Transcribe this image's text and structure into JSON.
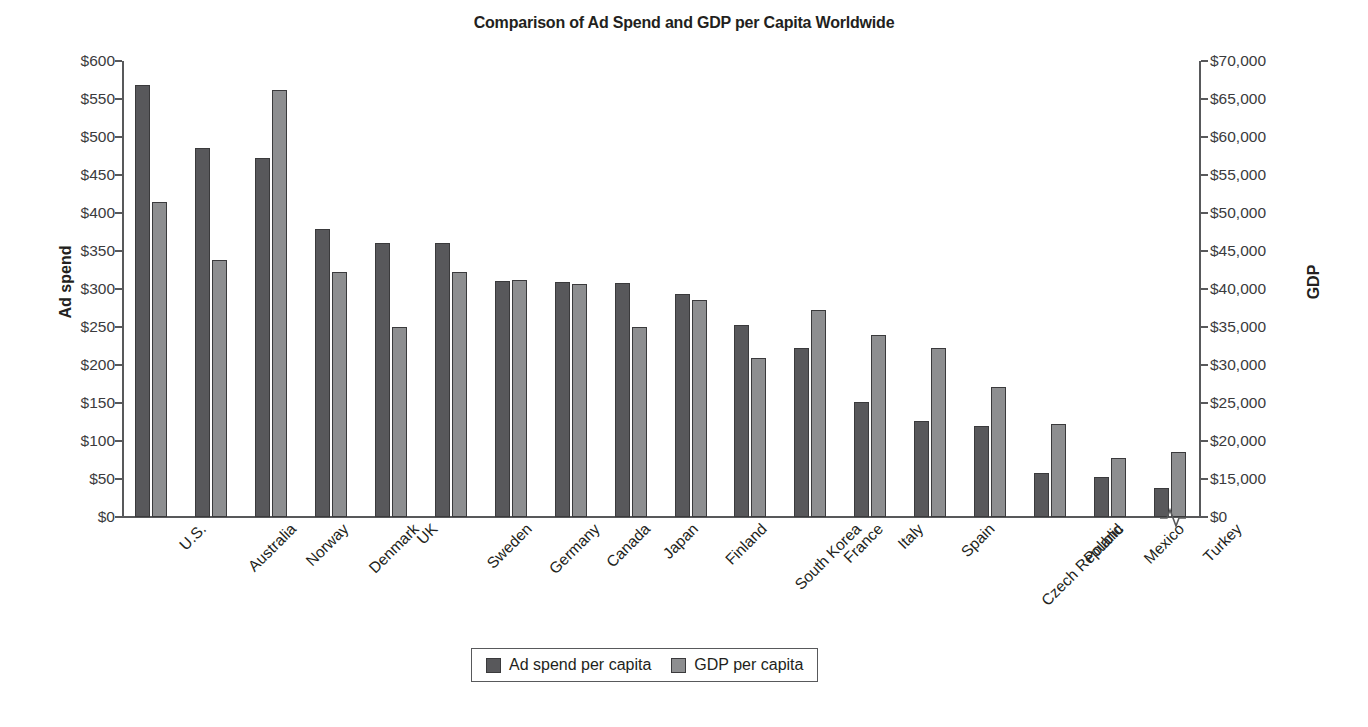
{
  "chart_data": {
    "type": "bar",
    "title": "Comparison of Ad Spend and GDP per Capita Worldwide",
    "xlabel": "",
    "ylabel": "Ad spend",
    "ylabel_right": "GDP",
    "grid": false,
    "legend_position": "bottom",
    "categories": [
      "U.S.",
      "Australia",
      "Norway",
      "Denmark",
      "UK",
      "Sweden",
      "Germany",
      "Canada",
      "Japan",
      "Finland",
      "South Korea",
      "France",
      "Italy",
      "Spain",
      "Czech Republic",
      "Poland",
      "Mexico",
      "Turkey"
    ],
    "series": [
      {
        "name": "Ad spend per capita",
        "axis": "left",
        "color": "#58585b",
        "values": [
          568,
          486,
          472,
          379,
          361,
          360,
          310,
          309,
          308,
          294,
          252,
          223,
          151,
          126,
          120,
          58,
          52,
          38
        ]
      },
      {
        "name": "GDP per capita",
        "axis": "right",
        "color": "#8d8e90",
        "values": [
          51500,
          43800,
          66200,
          42300,
          35000,
          42300,
          41200,
          40600,
          35000,
          38500,
          30900,
          37200,
          33900,
          32200,
          27100,
          22300,
          17800,
          18500
        ]
      }
    ],
    "left_axis": {
      "label": "Ad spend",
      "ticks": [
        "$0",
        "$50",
        "$100",
        "$150",
        "$200",
        "$250",
        "$300",
        "$350",
        "$400",
        "$450",
        "$500",
        "$550",
        "$600"
      ],
      "tick_values": [
        0,
        50,
        100,
        150,
        200,
        250,
        300,
        350,
        400,
        450,
        500,
        550,
        600
      ],
      "ylim": [
        0,
        600
      ]
    },
    "right_axis": {
      "label": "GDP",
      "ticks": [
        "$0",
        "$15,000",
        "$20,000",
        "$25,000",
        "$30,000",
        "$35,000",
        "$40,000",
        "$45,000",
        "$50,000",
        "$55,000",
        "$60,000",
        "$65,000",
        "$70,000"
      ],
      "tick_values": [
        0,
        15000,
        20000,
        25000,
        30000,
        35000,
        40000,
        45000,
        50000,
        55000,
        60000,
        65000,
        70000
      ],
      "ylim": [
        0,
        70000
      ],
      "has_axis_break": true,
      "break_note": "axis break between $0 and $15,000"
    }
  },
  "legend": {
    "items": [
      {
        "label": "Ad spend per capita",
        "color": "#58585b"
      },
      {
        "label": "GDP per capita",
        "color": "#8d8e90"
      }
    ]
  }
}
